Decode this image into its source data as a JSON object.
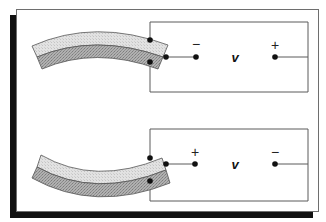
{
  "figure": {
    "colors": {
      "frame": "#6e6e6e",
      "shadow": "#111111",
      "wire": "#5a5a5a",
      "layer_top": "#dcdcdc",
      "layer_bottom": "#a9a9a9",
      "dot": "#111111"
    },
    "panels": [
      {
        "name": "top",
        "bend": "concave-down",
        "left_sign": "−",
        "voltage_label": "v",
        "right_sign": "+"
      },
      {
        "name": "bottom",
        "bend": "concave-up",
        "left_sign": "+",
        "voltage_label": "v",
        "right_sign": "−"
      }
    ]
  }
}
